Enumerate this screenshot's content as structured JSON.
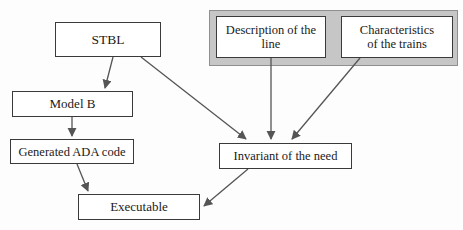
{
  "diagram": {
    "background_color": "#fdfdfd",
    "line_color": "#555555",
    "node_border_color": "#3a3a3a",
    "panel_fill_color": "#c6c6c6",
    "nodes": {
      "stbl": {
        "label": "STBL"
      },
      "model_b": {
        "label": "Model B"
      },
      "generated_ada_code": {
        "label": "Generated ADA code"
      },
      "executable": {
        "label": "Executable"
      },
      "invariant": {
        "label": "Invariant of the need"
      },
      "description_line": {
        "label": "Description of the\nline"
      },
      "characteristics_trains": {
        "label": "Characteristics\nof the trains"
      }
    },
    "edges": [
      {
        "name": "stbl-to-model-b",
        "from": "stbl",
        "to": "model_b"
      },
      {
        "name": "stbl-to-invariant",
        "from": "stbl",
        "to": "invariant"
      },
      {
        "name": "model-b-to-generated-ada-code",
        "from": "model_b",
        "to": "generated_ada_code"
      },
      {
        "name": "generated-ada-code-to-executable",
        "from": "generated_ada_code",
        "to": "executable"
      },
      {
        "name": "description-line-to-invariant",
        "from": "description_line",
        "to": "invariant"
      },
      {
        "name": "characteristics-trains-to-invariant",
        "from": "characteristics_trains",
        "to": "invariant"
      },
      {
        "name": "invariant-to-executable",
        "from": "invariant",
        "to": "executable"
      }
    ]
  }
}
